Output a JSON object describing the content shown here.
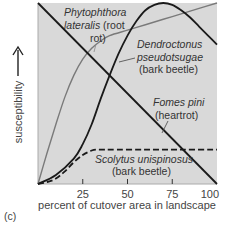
{
  "chart_data": {
    "type": "line",
    "title": "",
    "panel_label": "(c)",
    "xlabel": "percent of cutover area in landscape",
    "ylabel": "susceptibility",
    "xlim": [
      0,
      100
    ],
    "ylim": [
      0,
      100
    ],
    "x_ticks": [
      25,
      50,
      75,
      100
    ],
    "x_tick_labels": [
      "25",
      "50",
      "75",
      "100"
    ],
    "grid": false,
    "background": "#d9d9d9",
    "series": [
      {
        "name": "Phytophthora lateralis (root rot)",
        "label_lines": [
          "Phytophthora",
          "lateralis (root",
          "rot)"
        ],
        "label_italic": [
          true,
          "partial",
          false
        ],
        "style": "solid",
        "color": "#7a7a7a",
        "x": [
          0,
          5,
          10,
          15,
          20,
          25,
          30,
          35,
          40,
          50,
          60,
          70,
          80,
          90,
          100
        ],
        "y": [
          0,
          17,
          33,
          48,
          60,
          69,
          75,
          79,
          82,
          85,
          88,
          91,
          94,
          97,
          100
        ]
      },
      {
        "name": "Dendroctonus pseudotsugae (bark beetle)",
        "label_lines": [
          "Dendroctonus",
          "pseudotsugae",
          "(bark beetle)"
        ],
        "style": "solid",
        "color": "#1a1a1a",
        "x": [
          0,
          10,
          20,
          25,
          30,
          35,
          40,
          45,
          50,
          55,
          60,
          65,
          70,
          75,
          80,
          85,
          90,
          95,
          100
        ],
        "y": [
          0,
          5,
          14,
          22,
          33,
          47,
          60,
          72,
          82,
          90,
          96,
          99,
          100,
          99,
          96,
          92,
          87,
          82,
          77
        ]
      },
      {
        "name": "Fomes pini (heartrot)",
        "label_lines": [
          "Fomes pini",
          "(heartrot)"
        ],
        "style": "solid",
        "color": "#1a1a1a",
        "x": [
          0,
          100
        ],
        "y": [
          100,
          0
        ]
      },
      {
        "name": "Scolytus unispinosus (bark beetle)",
        "label_lines": [
          "Scolytus unispinosus",
          "(bark beetle)"
        ],
        "style": "dashed",
        "color": "#1a1a1a",
        "x": [
          0,
          5,
          10,
          15,
          20,
          25,
          30,
          33,
          40,
          60,
          80,
          100
        ],
        "y": [
          0,
          1,
          3,
          7,
          12,
          16,
          18.5,
          19,
          19,
          19,
          19,
          19
        ]
      }
    ]
  }
}
